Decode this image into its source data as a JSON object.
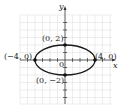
{
  "diagram": {
    "type": "ellipse-graph",
    "equation_shape": "horizontal ellipse centered at origin",
    "axes": {
      "x_label": "x",
      "y_label": "y",
      "origin_label": "0"
    },
    "semi_major": 4,
    "semi_minor": 2,
    "points": [
      {
        "label": "(0, 2)",
        "x": 0,
        "y": 2
      },
      {
        "label": "(−4, 0)",
        "x": -4,
        "y": 0
      },
      {
        "label": "(4, 0)",
        "x": 4,
        "y": 0
      },
      {
        "label": "(0, −2)",
        "x": 0,
        "y": -2
      }
    ],
    "colors": {
      "curve": "#1a1a1a",
      "grid": "#dcdcdc",
      "axis": "#333333"
    }
  }
}
